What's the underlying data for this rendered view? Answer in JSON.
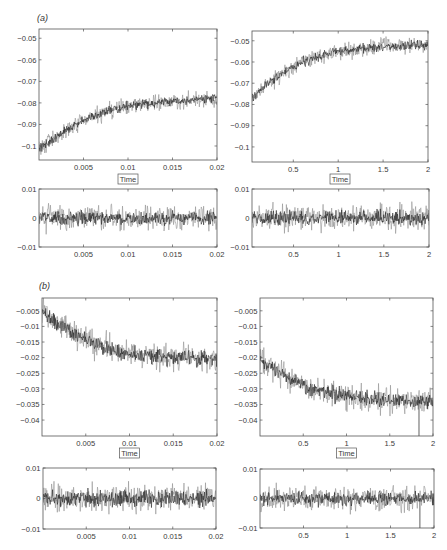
{
  "figure": {
    "panels": [
      {
        "label": "(a)"
      },
      {
        "label": "(b)"
      }
    ]
  },
  "style": {
    "trace_light_color": "#8c8c8c",
    "trace_dark_color": "#1c1c1c",
    "axes_color": "#555555",
    "background": "#ffffff"
  },
  "chart_data": [
    {
      "id": "a-left-main",
      "panel": "(a)",
      "type": "line",
      "title": "",
      "xlabel": "Time",
      "ylabel": "",
      "xlim": [
        0,
        0.02
      ],
      "ylim": [
        -0.1065,
        -0.0457
      ],
      "xticks": [
        0.005,
        0.01,
        0.015,
        0.02
      ],
      "xtick_labels": [
        "0.005",
        "0.01",
        "0.015",
        "0.02"
      ],
      "yticks": [
        -0.1,
        -0.09,
        -0.08,
        -0.07,
        -0.06,
        -0.05
      ],
      "ytick_labels": [
        "−0.1",
        "−0.09",
        "−0.08",
        "−0.07",
        "−0.06",
        "−0.05"
      ],
      "grid": false,
      "series": [
        {
          "name": "signal",
          "x": [
            0,
            0.002,
            0.004,
            0.006,
            0.008,
            0.01,
            0.012,
            0.014,
            0.016,
            0.018,
            0.02
          ],
          "values": [
            -0.101,
            -0.0955,
            -0.0905,
            -0.0865,
            -0.0835,
            -0.0815,
            -0.0805,
            -0.0795,
            -0.079,
            -0.0785,
            -0.078
          ],
          "noise_amplitude": 0.0055
        }
      ],
      "outliers": []
    },
    {
      "id": "a-right-main",
      "panel": "(a)",
      "type": "line",
      "title": "",
      "xlabel": "Time",
      "ylabel": "",
      "xlim": [
        0.04,
        2
      ],
      "ylim": [
        -0.1071,
        -0.0454
      ],
      "xticks": [
        0.5,
        1,
        1.5,
        2
      ],
      "xtick_labels": [
        "0.5",
        "1",
        "1.5",
        "2"
      ],
      "yticks": [
        -0.1,
        -0.09,
        -0.08,
        -0.07,
        -0.06,
        -0.05
      ],
      "ytick_labels": [
        "−0.1",
        "−0.09",
        "−0.08",
        "−0.07",
        "−0.06",
        "−0.05"
      ],
      "grid": false,
      "series": [
        {
          "name": "signal",
          "x": [
            0.04,
            0.2,
            0.4,
            0.6,
            0.8,
            1.0,
            1.2,
            1.4,
            1.6,
            1.8,
            2.0
          ],
          "values": [
            -0.0775,
            -0.0705,
            -0.0645,
            -0.06,
            -0.057,
            -0.055,
            -0.054,
            -0.053,
            -0.0525,
            -0.0522,
            -0.052
          ],
          "noise_amplitude": 0.0055
        }
      ],
      "outliers": []
    },
    {
      "id": "a-left-residual",
      "panel": "(a)",
      "type": "line",
      "title": "",
      "xlabel": "",
      "ylabel": "",
      "xlim": [
        0,
        0.02
      ],
      "ylim": [
        -0.01,
        0.01
      ],
      "xticks": [
        0.005,
        0.01,
        0.015,
        0.02
      ],
      "xtick_labels": [
        "0.005",
        "0.01",
        "0.015",
        "0.02"
      ],
      "yticks": [
        -0.01,
        0,
        0.01
      ],
      "ytick_labels": [
        "−0.01",
        "0",
        "0.01"
      ],
      "grid": false,
      "series": [
        {
          "name": "residual",
          "x": [
            0,
            0.02
          ],
          "values": [
            0,
            0
          ],
          "noise_amplitude": 0.006
        }
      ],
      "outliers": []
    },
    {
      "id": "a-right-residual",
      "panel": "(a)",
      "type": "line",
      "title": "",
      "xlabel": "",
      "ylabel": "",
      "xlim": [
        0.04,
        2
      ],
      "ylim": [
        -0.01,
        0.01
      ],
      "xticks": [
        0.5,
        1,
        1.5,
        2
      ],
      "xtick_labels": [
        "0.5",
        "1",
        "1.5",
        "2"
      ],
      "yticks": [
        -0.01,
        0,
        0.01
      ],
      "ytick_labels": [
        "−0.01",
        "0",
        "0.01"
      ],
      "grid": false,
      "series": [
        {
          "name": "residual",
          "x": [
            0.04,
            2
          ],
          "values": [
            0,
            0
          ],
          "noise_amplitude": 0.0065
        }
      ],
      "outliers": []
    },
    {
      "id": "b-left-main",
      "panel": "(b)",
      "type": "line",
      "title": "",
      "xlabel": "Time",
      "ylabel": "",
      "xlim": [
        0,
        0.02
      ],
      "ylim": [
        -0.0451,
        -0.0009
      ],
      "xticks": [
        0.005,
        0.01,
        0.015,
        0.02
      ],
      "xtick_labels": [
        "0.005",
        "0.01",
        "0.015",
        "0.02"
      ],
      "yticks": [
        -0.04,
        -0.035,
        -0.03,
        -0.025,
        -0.02,
        -0.015,
        -0.01,
        -0.005
      ],
      "ytick_labels": [
        "−0.04",
        "−0.035",
        "−0.03",
        "−0.025",
        "−0.02",
        "−0.015",
        "−0.01",
        "−0.005"
      ],
      "grid": false,
      "series": [
        {
          "name": "signal",
          "x": [
            0,
            0.002,
            0.004,
            0.006,
            0.008,
            0.01,
            0.012,
            0.014,
            0.016,
            0.018,
            0.02
          ],
          "values": [
            -0.0055,
            -0.0095,
            -0.0128,
            -0.0155,
            -0.0175,
            -0.0188,
            -0.0194,
            -0.0197,
            -0.0199,
            -0.0202,
            -0.0207
          ],
          "noise_amplitude": 0.0062
        }
      ],
      "outliers": []
    },
    {
      "id": "b-right-main",
      "panel": "(b)",
      "type": "line",
      "title": "",
      "xlabel": "Time",
      "ylabel": "",
      "xlim": [
        0,
        2
      ],
      "ylim": [
        -0.0451,
        -0.0009
      ],
      "xticks": [
        0.5,
        1,
        1.5,
        2
      ],
      "xtick_labels": [
        "0.5",
        "1",
        "1.5",
        "2"
      ],
      "yticks": [
        -0.04,
        -0.035,
        -0.03,
        -0.025,
        -0.02,
        -0.015,
        -0.01,
        -0.005
      ],
      "ytick_labels": [
        "−0.04",
        "−0.035",
        "−0.03",
        "−0.025",
        "−0.02",
        "−0.015",
        "−0.01",
        "−0.005"
      ],
      "grid": false,
      "series": [
        {
          "name": "signal",
          "x": [
            0,
            0.2,
            0.4,
            0.6,
            0.8,
            1.0,
            1.2,
            1.4,
            1.6,
            1.8,
            2.0
          ],
          "values": [
            -0.0205,
            -0.0245,
            -0.0275,
            -0.0298,
            -0.0313,
            -0.0323,
            -0.033,
            -0.0334,
            -0.0337,
            -0.0339,
            -0.0341
          ],
          "noise_amplitude": 0.0062
        }
      ],
      "outliers": [
        {
          "x": 1.838,
          "value": -0.047
        }
      ]
    },
    {
      "id": "b-left-residual",
      "panel": "(b)",
      "type": "line",
      "title": "",
      "xlabel": "",
      "ylabel": "",
      "xlim": [
        0,
        0.02
      ],
      "ylim": [
        -0.01,
        0.01
      ],
      "xticks": [
        0.005,
        0.01,
        0.015,
        0.02
      ],
      "xtick_labels": [
        "0.005",
        "0.01",
        "0.015",
        "0.02"
      ],
      "yticks": [
        -0.01,
        0,
        0.01
      ],
      "ytick_labels": [
        "−0.01",
        "0",
        "0.01"
      ],
      "grid": false,
      "series": [
        {
          "name": "residual",
          "x": [
            0,
            0.02
          ],
          "values": [
            0,
            0
          ],
          "noise_amplitude": 0.0068
        }
      ],
      "outliers": []
    },
    {
      "id": "b-right-residual",
      "panel": "(b)",
      "type": "line",
      "title": "",
      "xlabel": "",
      "ylabel": "",
      "xlim": [
        0,
        2
      ],
      "ylim": [
        -0.01,
        0.01
      ],
      "xticks": [
        0.5,
        1,
        1.5,
        2
      ],
      "xtick_labels": [
        "0.5",
        "1",
        "1.5",
        "2"
      ],
      "yticks": [
        -0.01,
        0,
        0.01
      ],
      "ytick_labels": [
        "−0.01",
        "0",
        "0.01"
      ],
      "grid": false,
      "series": [
        {
          "name": "residual",
          "x": [
            0,
            2
          ],
          "values": [
            0,
            0
          ],
          "noise_amplitude": 0.0062
        }
      ],
      "outliers": [
        {
          "x": 1.838,
          "value": -0.0105
        }
      ]
    }
  ]
}
